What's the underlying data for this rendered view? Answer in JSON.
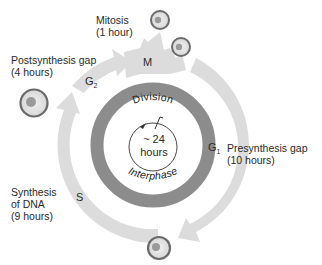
{
  "labels": {
    "mitosis": {
      "name": "Mitosis",
      "duration": "(1 hour)"
    },
    "postsynthesis": {
      "name": "Postsynthesis gap",
      "duration": "(4 hours)"
    },
    "presynthesis": {
      "name": "Presynthesis gap",
      "duration": "(10 hours)"
    },
    "synthesis": {
      "name1": "Synthesis",
      "name2": "of DNA",
      "duration": "(9 hours)"
    }
  },
  "phases": {
    "m": "M",
    "g2": "G",
    "g2_sub": "2",
    "g1": "G",
    "g1_sub": "1",
    "s": "S"
  },
  "inner_ring": {
    "top": "Division",
    "bottom": "Interphase"
  },
  "center": {
    "line1": "~ 24",
    "line2": "hours"
  },
  "colors": {
    "outer_ring": "#dcdcdc",
    "inner_ring": "#8c8c8c",
    "cell_outline": "#6a6a6a",
    "cell_fill": "#e4e4e4",
    "nucleus": "#9a9a9a"
  }
}
